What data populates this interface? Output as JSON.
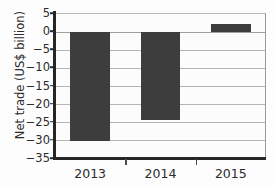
{
  "chart_data": {
    "type": "bar",
    "title": "",
    "xlabel": "",
    "ylabel": "Net trade (US$ billion)",
    "categories": [
      "2013",
      "2014",
      "2015"
    ],
    "values": [
      -30.0,
      -24.3,
      2.3
    ],
    "series": [
      {
        "name": "Net trade",
        "values": [
          -30.0,
          -24.3,
          2.3
        ]
      }
    ],
    "ylim": [
      -35,
      5
    ],
    "ytick_values": [
      5,
      0,
      -5,
      -10,
      -15,
      -20,
      -25,
      -30,
      -35
    ],
    "ytick_labels": [
      "5",
      "0",
      "−5",
      "−10",
      "−15",
      "−20",
      "−25",
      "−30",
      "−35"
    ],
    "grid": true,
    "legend": "none",
    "bar_color": "#3d3d3d",
    "grid_color": "#b4b4b4",
    "axis_color": "#262626",
    "background_color": "#fcfcfc"
  },
  "axes": {
    "y_title": "Net trade (US$ billion)"
  }
}
